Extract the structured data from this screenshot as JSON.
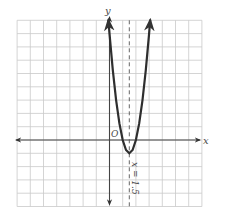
{
  "chart_data": {
    "type": "line",
    "title": "",
    "xlabel": "x",
    "ylabel": "y",
    "origin_label": "O",
    "xlim": [
      -7,
      7
    ],
    "ylim": [
      -5,
      9
    ],
    "grid": true,
    "grid_step": 1,
    "tick_labels": "none",
    "series": [
      {
        "name": "parabola",
        "equation_estimate": "y = 4x^2 - 12x + 8",
        "vertex": [
          1.5,
          -1
        ],
        "x_intercepts": [
          1,
          2
        ],
        "points": [
          [
            -0.08,
            8.99
          ],
          [
            0,
            8
          ],
          [
            0.25,
            5.25
          ],
          [
            0.5,
            3
          ],
          [
            0.75,
            1.25
          ],
          [
            1,
            0
          ],
          [
            1.25,
            -0.75
          ],
          [
            1.5,
            -1
          ],
          [
            1.75,
            -0.75
          ],
          [
            2,
            0
          ],
          [
            2.25,
            1.25
          ],
          [
            2.5,
            3
          ],
          [
            2.75,
            5.25
          ],
          [
            3,
            8
          ],
          [
            3.08,
            8.99
          ]
        ],
        "color": "#2e2e2e",
        "arrows_at_ends": true
      }
    ],
    "annotations": [
      {
        "type": "dashed-vertical-line",
        "x": 1.5,
        "label": "x = 1.5",
        "label_rotation": 90
      }
    ]
  },
  "labels": {
    "x_axis": "x",
    "y_axis": "y",
    "origin": "O",
    "symmetry": "x = 1.5"
  },
  "colors": {
    "grid": "#c9c9c9",
    "axis": "#444444",
    "curve": "#2e2e2e",
    "background": "#ffffff"
  }
}
